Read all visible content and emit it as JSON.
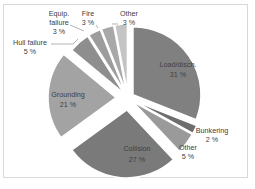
{
  "chart_data": {
    "type": "pie",
    "title": "",
    "exploded": true,
    "categories": [
      "Load/disch.",
      "Bunkering",
      "Other",
      "Collision",
      "Grounding",
      "Hull failure",
      "Equip. failure",
      "Fire",
      "Other"
    ],
    "values": [
      31,
      2,
      5,
      27,
      21,
      5,
      3,
      3,
      3
    ],
    "unit": "%",
    "slices": [
      {
        "label": "Load/disch.",
        "value": 31,
        "value_label": "31 %",
        "color": "#808080",
        "explode": 6,
        "label_pos": "inside"
      },
      {
        "label": "Bunkering",
        "value": 2,
        "value_label": "2 %",
        "color": "#6e6e6e",
        "explode": 6,
        "label_pos": "outside"
      },
      {
        "label": "Other",
        "value": 5,
        "value_label": "5 %",
        "color": "#9a9a9a",
        "explode": 6,
        "label_pos": "outside"
      },
      {
        "label": "Collision",
        "value": 27,
        "value_label": "27 %",
        "color": "#7a7a7a",
        "explode": 12,
        "label_pos": "inside"
      },
      {
        "label": "Grounding",
        "value": 21,
        "value_label": "21 %",
        "color": "#a3a3a3",
        "explode": 12,
        "label_pos": "inside"
      },
      {
        "label": "Hull failure",
        "value": 5,
        "value_label": "5 %",
        "color": "#8e8e8e",
        "explode": 6,
        "label_pos": "outside"
      },
      {
        "label": "Equip. failure",
        "value": 3,
        "value_label": "3 %",
        "color": "#9c9c9c",
        "explode": 6,
        "label_pos": "outside"
      },
      {
        "label": "Fire",
        "value": 3,
        "value_label": "3 %",
        "color": "#a8a8a8",
        "explode": 6,
        "label_pos": "outside"
      },
      {
        "label": "Other",
        "value": 3,
        "value_label": "3 %",
        "color": "#c4c4c4",
        "explode": 6,
        "label_pos": "outside"
      }
    ],
    "legend": "none",
    "grid": false
  },
  "labels": {
    "load_name": "Load/disch.",
    "load_pct": "31 %",
    "bunkering_name": "Bunkering",
    "bunkering_pct": "2 %",
    "other_b_name": "Other",
    "other_b_pct": "5 %",
    "collision_name": "Collision",
    "collision_pct": "27 %",
    "grounding_name": "Grounding",
    "grounding_pct": "21 %",
    "hull_name": "Hull failure",
    "hull_pct": "5 %",
    "equip_name1": "Equip.",
    "equip_name2": "failure",
    "equip_pct": "3 %",
    "fire_name": "Fire",
    "fire_pct": "3 %",
    "other_t_name": "Other",
    "other_t_pct": "3 %"
  }
}
